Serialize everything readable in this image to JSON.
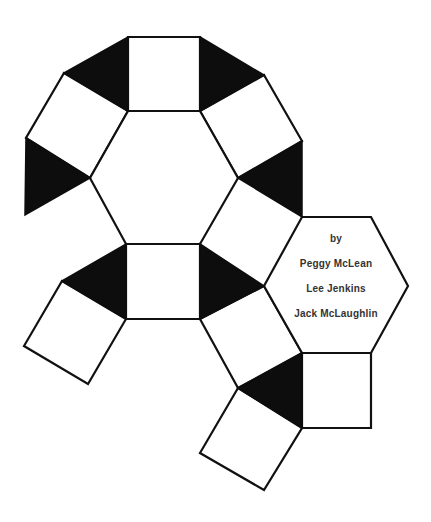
{
  "diagram": {
    "colors": {
      "background": "#ffffff",
      "stroke": "#111111",
      "shaded": "#0d0d0d",
      "text": "#333333"
    },
    "credits": {
      "by": "by",
      "authors": [
        "Peggy McLean",
        "Lee Jenkins",
        "Jack McLaughlin"
      ]
    },
    "faces": {
      "hexagons": [
        {
          "name": "main-hexagon",
          "points": "128,111 200,111 238,178 200,244 126,244 90,178"
        },
        {
          "name": "credits-hexagon",
          "points": "302,217 371,217 408,286 371,353 302,353 264,286"
        }
      ],
      "squares": [
        {
          "name": "top-square",
          "points": "128,37 200,37 200,111 128,111"
        },
        {
          "name": "upper-left-square",
          "points": "64,73 128,111 90,178 26,138"
        },
        {
          "name": "upper-right-square",
          "points": "200,111 264,75 302,141 238,178"
        },
        {
          "name": "lower-middle-square",
          "points": "126,244 200,244 200,319 126,319"
        },
        {
          "name": "lower-left-square",
          "points": "62,281 126,319 88,384 24,346"
        },
        {
          "name": "lower-right-square",
          "points": "200,319 264,286 302,353 238,388"
        },
        {
          "name": "bottom-right-square",
          "points": "302,353 371,353 371,428 302,428"
        },
        {
          "name": "bottom-square",
          "points": "238,388 302,428 264,490 200,453"
        }
      ],
      "triangles": [
        {
          "name": "top-left-triangle",
          "points": "64,73 128,37 128,111"
        },
        {
          "name": "top-right-triangle",
          "points": "200,37 264,75 200,111"
        },
        {
          "name": "left-triangle",
          "points": "26,138 90,178 25,215"
        },
        {
          "name": "right-triangle",
          "points": "302,141 302,217 238,178"
        },
        {
          "name": "lower-left-triangle",
          "points": "62,281 126,244 126,319"
        },
        {
          "name": "lower-right-triangle",
          "points": "200,244 264,286 200,319"
        },
        {
          "name": "bottom-triangle",
          "points": "238,388 302,353 302,428"
        }
      ]
    }
  }
}
